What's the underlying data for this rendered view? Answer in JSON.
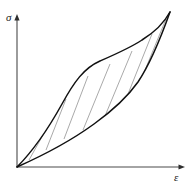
{
  "figure": {
    "name": "stress-strain-hysteresis-loop",
    "background_color": "#ffffff",
    "curve_color": "#111111",
    "hatch_color": "#9a9a9a",
    "axis_color": "#4a4a4a"
  },
  "axes": {
    "y_axis": {
      "label": "σ",
      "label_name": "sigma",
      "label_x": 6,
      "label_y": 21,
      "x": 17,
      "y_top": 14,
      "y_bottom": 167,
      "arrow": "up"
    },
    "x_axis": {
      "label": "ε",
      "label_name": "epsilon",
      "label_x": 174,
      "label_y": 181,
      "y": 167,
      "x_left": 17,
      "x_right": 185,
      "arrow": "right"
    }
  },
  "chart_data": {
    "type": "line",
    "title": "",
    "xlabel": "ε",
    "ylabel": "σ",
    "grid": false,
    "legend": null,
    "origin": [
      17,
      167
    ],
    "apex": [
      170,
      12
    ],
    "series": [
      {
        "name": "loading-curve-upper",
        "role": "upper-branch",
        "color": "#111111",
        "path": "M 17 167 C 38 146, 52 122, 62 104 C 74 82, 84 68, 100 61 C 116 54, 130 48, 142 40 C 155 32, 164 23, 170 12"
      },
      {
        "name": "unloading-curve-lower",
        "role": "lower-branch",
        "color": "#111111",
        "path": "M 17 167 C 44 155, 72 140, 94 124 C 112 111, 126 99, 138 82 C 150 64, 160 40, 170 12"
      }
    ],
    "hatch_lines": [
      {
        "x1": 29,
        "y1": 160,
        "x2": 43,
        "y2": 135
      },
      {
        "x1": 46,
        "y1": 150,
        "x2": 66,
        "y2": 99
      },
      {
        "x1": 64,
        "y1": 139,
        "x2": 88,
        "y2": 76
      },
      {
        "x1": 83,
        "y1": 130,
        "x2": 110,
        "y2": 64
      },
      {
        "x1": 105,
        "y1": 116,
        "x2": 132,
        "y2": 51
      },
      {
        "x1": 126,
        "y1": 99,
        "x2": 152,
        "y2": 34
      },
      {
        "x1": 143,
        "y1": 75,
        "x2": 166,
        "y2": 19
      }
    ]
  }
}
